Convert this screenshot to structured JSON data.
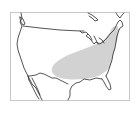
{
  "map": {
    "type": "range-map",
    "region": "United States",
    "colors": {
      "background": "#ffffff",
      "frame": "#c8c8c8",
      "outline": "#2a2a2a",
      "range_fill": "#d2d2d2"
    },
    "layers": [
      {
        "name": "frame"
      },
      {
        "name": "us-outline"
      },
      {
        "name": "great-lakes"
      },
      {
        "name": "range-area"
      }
    ]
  }
}
